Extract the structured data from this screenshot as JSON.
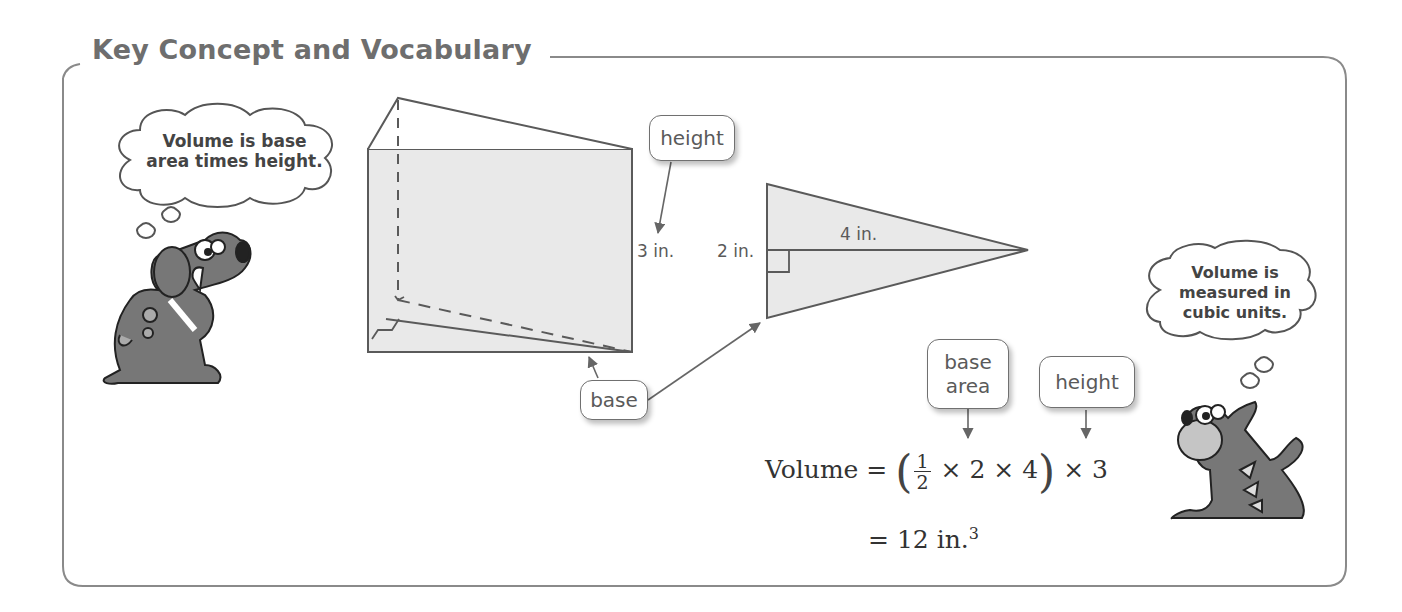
{
  "section": {
    "title": "Key Concept and Vocabulary"
  },
  "characters": {
    "dog": {
      "thought": [
        "Volume is base",
        "area times height."
      ]
    },
    "cat": {
      "thought": [
        "Volume is",
        "measured in",
        "cubic units."
      ]
    }
  },
  "prism": {
    "labels": {
      "height": "height",
      "base": "base"
    },
    "dimension_height": "3 in."
  },
  "triangle": {
    "dimension_base": "2 in.",
    "dimension_height": "4 in."
  },
  "formula": {
    "labels": {
      "base_area": [
        "base",
        "area"
      ],
      "height": "height"
    },
    "line1": {
      "lhs": "Volume =",
      "frac_num": "1",
      "frac_den": "2",
      "inner": "× 2 × 4",
      "outer": "× 3"
    },
    "line2": {
      "text": "= 12 in.",
      "exponent": "3"
    }
  },
  "colors": {
    "frame": "#8a8a8a",
    "shape_fill": "#e9e9e9",
    "shape_stroke": "#5a5a5a",
    "animal_fill": "#777777"
  }
}
